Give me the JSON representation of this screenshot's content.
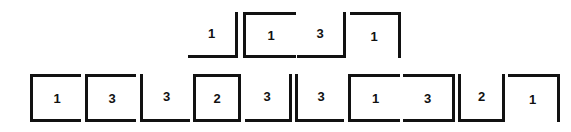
{
  "figure": {
    "background_color": "#ffffff",
    "stroke_color": "#111111",
    "stroke_width": 3,
    "width": 571,
    "height": 132
  },
  "rows": [
    {
      "name": "top-row",
      "y": 12,
      "cell_height": 46,
      "cells": [
        {
          "label": "1",
          "x": 188,
          "width": 50,
          "edges": {
            "top": false,
            "right": true,
            "bottom": true,
            "left": false
          }
        },
        {
          "label": "1",
          "x": 243,
          "width": 53,
          "edges": {
            "top": true,
            "right": false,
            "bottom": true,
            "left": true
          }
        },
        {
          "label": "3",
          "x": 297,
          "width": 49,
          "edges": {
            "top": false,
            "right": true,
            "bottom": true,
            "left": false
          }
        },
        {
          "label": "1",
          "x": 350,
          "width": 51,
          "edges": {
            "top": true,
            "right": true,
            "bottom": false,
            "left": false
          }
        }
      ]
    },
    {
      "name": "bottom-row",
      "y": 74,
      "cell_height": 48,
      "cells": [
        {
          "label": "1",
          "x": 30,
          "width": 51,
          "edges": {
            "top": true,
            "right": false,
            "bottom": true,
            "left": true
          }
        },
        {
          "label": "3",
          "x": 85,
          "width": 51,
          "edges": {
            "top": true,
            "right": false,
            "bottom": true,
            "left": true
          }
        },
        {
          "label": "3",
          "x": 140,
          "width": 50,
          "edges": {
            "top": false,
            "right": false,
            "bottom": true,
            "left": true
          }
        },
        {
          "label": "2",
          "x": 193,
          "width": 48,
          "edges": {
            "top": true,
            "right": true,
            "bottom": true,
            "left": true
          }
        },
        {
          "label": "3",
          "x": 245,
          "width": 47,
          "edges": {
            "top": false,
            "right": true,
            "bottom": true,
            "left": false
          }
        },
        {
          "label": "3",
          "x": 295,
          "width": 49,
          "edges": {
            "top": false,
            "right": false,
            "bottom": true,
            "left": true
          }
        },
        {
          "label": "1",
          "x": 348,
          "width": 52,
          "edges": {
            "top": true,
            "right": false,
            "bottom": true,
            "left": true
          }
        },
        {
          "label": "3",
          "x": 403,
          "width": 52,
          "edges": {
            "top": true,
            "right": true,
            "bottom": true,
            "left": false
          }
        },
        {
          "label": "2",
          "x": 458,
          "width": 47,
          "edges": {
            "top": false,
            "right": true,
            "bottom": true,
            "left": true
          }
        },
        {
          "label": "1",
          "x": 508,
          "width": 52,
          "edges": {
            "top": true,
            "right": true,
            "bottom": false,
            "left": false
          }
        }
      ]
    }
  ]
}
